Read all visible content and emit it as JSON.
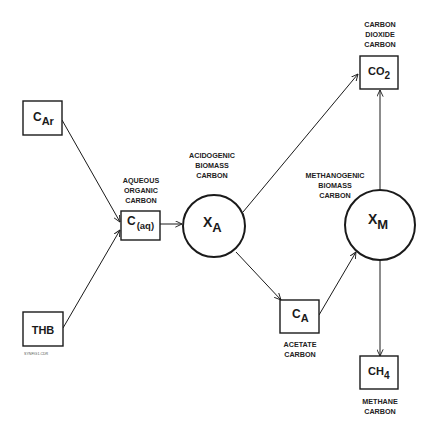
{
  "diagram": {
    "type": "flow",
    "nodes": {
      "c_ar": {
        "symbol": "C",
        "subscript": "Ar",
        "shape": "box",
        "label_lines": []
      },
      "thb": {
        "symbol": "THB",
        "subscript": "",
        "shape": "box",
        "label_lines": []
      },
      "c_aq": {
        "symbol": "C",
        "subscript": "(aq)",
        "shape": "box",
        "label_lines": [
          "AQUEOUS",
          "ORGANIC",
          "CARBON"
        ]
      },
      "x_a": {
        "symbol": "X",
        "subscript": "A",
        "shape": "circle",
        "label_lines": [
          "ACIDOGENIC",
          "BIOMASS",
          "CARBON"
        ]
      },
      "c_a": {
        "symbol": "C",
        "subscript": "A",
        "shape": "box",
        "label_lines": [
          "ACETATE",
          "CARBON"
        ]
      },
      "x_m": {
        "symbol": "X",
        "subscript": "M",
        "shape": "circle",
        "label_lines": [
          "METHANOGENIC",
          "BIOMASS",
          "CARBON"
        ]
      },
      "co2": {
        "symbol": "CO",
        "subscript": "2",
        "shape": "box",
        "label_lines": [
          "CARBON",
          "DIOXIDE",
          "CARBON"
        ]
      },
      "ch4": {
        "symbol": "CH",
        "subscript": "4",
        "shape": "box",
        "label_lines": [
          "METHANE",
          "CARBON"
        ]
      }
    },
    "edges": [
      {
        "from": "c_ar",
        "to": "c_aq"
      },
      {
        "from": "thb",
        "to": "c_aq"
      },
      {
        "from": "c_aq",
        "to": "x_a"
      },
      {
        "from": "x_a",
        "to": "co2"
      },
      {
        "from": "x_a",
        "to": "c_a"
      },
      {
        "from": "c_a",
        "to": "x_m"
      },
      {
        "from": "x_m",
        "to": "co2"
      },
      {
        "from": "x_m",
        "to": "ch4"
      }
    ],
    "footnote": "SYNFIG1.CDR"
  }
}
